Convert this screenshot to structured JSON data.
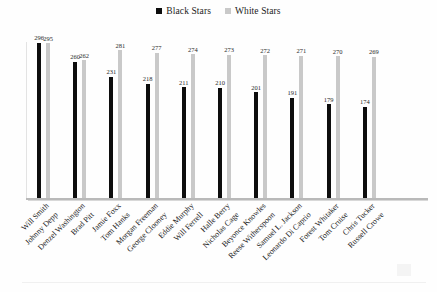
{
  "legend": {
    "position": "top-center",
    "entries": [
      {
        "label": "Black Stars",
        "color": "#0d0d0d",
        "swatch_name": "legend-swatch-black-stars"
      },
      {
        "label": "White Stars",
        "color": "#c9c9c9",
        "swatch_name": "legend-swatch-white-stars"
      }
    ]
  },
  "chart_data": {
    "type": "bar",
    "title": "",
    "subtitle": "",
    "xlabel": "",
    "ylabel": "",
    "ylim": [
      0,
      320
    ],
    "grid": false,
    "legend_position": "top-center",
    "categories": [
      [
        "Will Smith",
        "Johnny Depp"
      ],
      [
        "Denzel Washington",
        "Brad Pitt"
      ],
      [
        "Jamie Foxx",
        "Tom Hanks"
      ],
      [
        "Morgan Freeman",
        "George Clooney"
      ],
      [
        "Eddie Murphy",
        "Will Ferrell"
      ],
      [
        "Halle Berry",
        "Nicholas Cage"
      ],
      [
        "Beyonce Knowles",
        "Reese Witherspoon"
      ],
      [
        "Samuel L. Jackson",
        "Leonardo Di Caprio"
      ],
      [
        "Forest Whitaker",
        "Tom Cruise"
      ],
      [
        "Chris Tucker",
        "Russell Crowe"
      ]
    ],
    "series": [
      {
        "name": "Black Stars",
        "color": "#0d0d0d",
        "values": [
          296,
          260,
          231,
          218,
          211,
          210,
          201,
          191,
          179,
          174
        ]
      },
      {
        "name": "White Stars",
        "color": "#c9c9c9",
        "values": [
          295,
          262,
          281,
          277,
          274,
          273,
          272,
          271,
          270,
          269
        ]
      }
    ]
  }
}
